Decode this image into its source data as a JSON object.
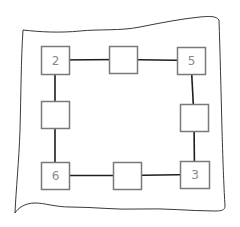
{
  "diagram": {
    "type": "number-square-puzzle",
    "colors": {
      "paper_outline": "#3a3a3a",
      "box_border": "#7a7a7a",
      "box_fill": "#ffffff",
      "connector": "#1e1e1e",
      "digit": "#8a8a8a",
      "background": "#ffffff"
    },
    "boxes": [
      {
        "id": "top-left",
        "label": "2",
        "x": 41,
        "y": 46,
        "w": 28,
        "h": 28
      },
      {
        "id": "top-middle",
        "label": "",
        "x": 109,
        "y": 46,
        "w": 28,
        "h": 27
      },
      {
        "id": "top-right",
        "label": "5",
        "x": 177,
        "y": 47,
        "w": 28,
        "h": 27
      },
      {
        "id": "middle-left",
        "label": "",
        "x": 41,
        "y": 101,
        "w": 28,
        "h": 27
      },
      {
        "id": "middle-right",
        "label": "",
        "x": 180,
        "y": 104,
        "w": 28,
        "h": 27
      },
      {
        "id": "bottom-left",
        "label": "6",
        "x": 41,
        "y": 162,
        "w": 28,
        "h": 27
      },
      {
        "id": "bottom-middle",
        "label": "",
        "x": 113,
        "y": 162,
        "w": 28,
        "h": 27
      },
      {
        "id": "bottom-right",
        "label": "3",
        "x": 180,
        "y": 161,
        "w": 29,
        "h": 27
      }
    ],
    "connections": [
      {
        "from": "top-left",
        "to": "top-middle"
      },
      {
        "from": "top-middle",
        "to": "top-right"
      },
      {
        "from": "top-right",
        "to": "middle-right"
      },
      {
        "from": "middle-right",
        "to": "bottom-right"
      },
      {
        "from": "bottom-right",
        "to": "bottom-middle"
      },
      {
        "from": "bottom-middle",
        "to": "bottom-left"
      },
      {
        "from": "bottom-left",
        "to": "middle-left"
      },
      {
        "from": "middle-left",
        "to": "top-left"
      }
    ]
  }
}
